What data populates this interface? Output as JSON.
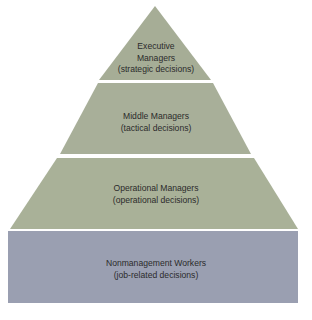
{
  "diagram": {
    "type": "pyramid",
    "tiers": [
      {
        "title": "Executive",
        "title2": "Managers",
        "subtitle": "(strategic decisions)",
        "color": "#a6ad96"
      },
      {
        "title": "Middle Managers",
        "subtitle": "(tactical decisions)",
        "color": "#a8af99"
      },
      {
        "title": "Operational Managers",
        "subtitle": "(operational decisions)",
        "color": "#a9b198"
      },
      {
        "title": "Nonmanagement Workers",
        "subtitle": "(job-related decisions)",
        "color": "#9a9fb1"
      }
    ],
    "separator_color": "#ffffff"
  }
}
